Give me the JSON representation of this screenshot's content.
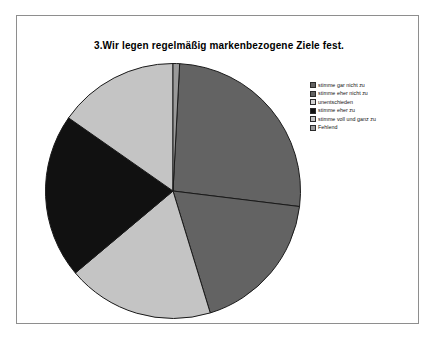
{
  "chart_data": {
    "type": "pie",
    "title": "3.Wir legen regelmäßig markenbezogene Ziele fest.",
    "xlabel": "",
    "ylabel": "",
    "legend_position": "right",
    "grid": false,
    "categories": [
      "stimme gar nicht zu",
      "stimme eher nicht zu",
      "unentschieden",
      "stimme eher zu",
      "stimme voll und ganz zu",
      "Fehlend"
    ],
    "values": [
      26.1,
      18.3,
      18.6,
      20.8,
      15.3,
      0.9
    ],
    "colors": [
      "#636363",
      "#636363",
      "#c4c4c4",
      "#111111",
      "#c4c4c4",
      "#9a9a9a"
    ],
    "slices": [
      {
        "label": "stimme gar nicht zu",
        "value": 26.1,
        "start_angle": 3,
        "end_angle": 97,
        "color": "#636363"
      },
      {
        "label": "stimme eher nicht zu",
        "value": 18.3,
        "start_angle": 97,
        "end_angle": 163,
        "color": "#636363"
      },
      {
        "label": "unentschieden",
        "value": 18.6,
        "start_angle": 163,
        "end_angle": 230,
        "color": "#c4c4c4"
      },
      {
        "label": "stimme eher zu",
        "value": 20.8,
        "start_angle": 230,
        "end_angle": 305,
        "color": "#111111"
      },
      {
        "label": "stimme voll und ganz zu",
        "value": 15.3,
        "start_angle": 305,
        "end_angle": 360,
        "color": "#c4c4c4"
      },
      {
        "label": "Fehlend",
        "value": 0.9,
        "start_angle": 0,
        "end_angle": 3,
        "color": "#9a9a9a"
      }
    ]
  },
  "chart": {
    "title": "3.Wir legen regelmäßig markenbezogene Ziele fest."
  },
  "legend": {
    "items": [
      {
        "label": "stimme gar nicht zu",
        "color": "#636363"
      },
      {
        "label": "stimme eher nicht zu",
        "color": "#636363"
      },
      {
        "label": "unentschieden",
        "color": "#d2d2d2"
      },
      {
        "label": "stimme eher zu",
        "color": "#111111"
      },
      {
        "label": "stimme voll und ganz zu",
        "color": "#c4c4c4"
      },
      {
        "label": "Fehlend",
        "color": "#9a9a9a"
      }
    ]
  }
}
